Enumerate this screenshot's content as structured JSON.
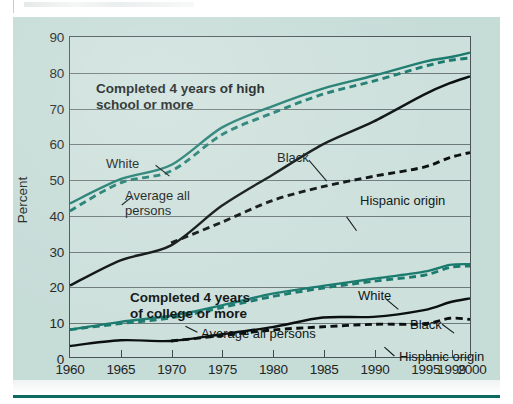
{
  "figure": {
    "background_color": "#c6dcd7",
    "accent_color": "#0d6b61",
    "teal_series_color": "#1b7a6e",
    "dark_series_color": "#0a0f10"
  },
  "chart_data": {
    "type": "line",
    "title": "",
    "xlabel": "",
    "ylabel": "Percent",
    "xlim": [
      1960,
      2000
    ],
    "ylim": [
      0,
      90
    ],
    "grid": true,
    "legend_position": "inline-annotations",
    "x": [
      1960,
      1965,
      1970,
      1975,
      1980,
      1985,
      1990,
      1995,
      1999,
      2000
    ],
    "xtick_labels": [
      "1960",
      "1965",
      "1970",
      "1975",
      "1980",
      "1985",
      "1990",
      "1995",
      "1999",
      "2000"
    ],
    "ytick_labels": [
      "0",
      "10",
      "20",
      "30",
      "40",
      "50",
      "60",
      "70",
      "80",
      "90"
    ],
    "ytick_values": [
      0,
      10,
      20,
      30,
      40,
      50,
      60,
      70,
      80,
      90
    ],
    "groups": [
      {
        "name": "Completed 4 years of high school or more",
        "series": [
          {
            "name": "White",
            "style": "solid",
            "color": "#1b7a6e",
            "values": [
              43.2,
              50.0,
              54.0,
              64.5,
              70.5,
              75.5,
              79.1,
              83.0,
              84.3,
              85.6
            ]
          },
          {
            "name": "Average all persons",
            "style": "dashed",
            "color": "#1b7a6e",
            "values": [
              41.1,
              49.0,
              52.3,
              62.5,
              68.6,
              73.9,
              77.6,
              81.7,
              83.4,
              84.1
            ]
          },
          {
            "name": "Black",
            "style": "solid",
            "color": "#0a0f10",
            "values": [
              20.1,
              27.2,
              31.4,
              42.5,
              51.2,
              59.8,
              66.2,
              73.8,
              77.0,
              78.9
            ]
          },
          {
            "name": "Hispanic origin",
            "style": "dashed",
            "color": "#0a0f10",
            "values": [
              null,
              null,
              32.1,
              37.9,
              44.0,
              47.9,
              50.8,
              53.4,
              56.1,
              57.5
            ]
          }
        ]
      },
      {
        "name": "Completed 4 years of college or more",
        "series": [
          {
            "name": "White",
            "style": "solid",
            "color": "#1b7a6e",
            "values": [
              7.7,
              9.9,
              11.6,
              14.5,
              17.8,
              20.0,
              22.0,
              24.0,
              25.9,
              26.1
            ]
          },
          {
            "name": "Average all persons",
            "style": "dashed",
            "color": "#1b7a6e",
            "values": [
              7.7,
              9.4,
              11.0,
              13.9,
              17.0,
              19.4,
              21.3,
              23.0,
              25.2,
              25.6
            ]
          },
          {
            "name": "Black",
            "style": "solid",
            "color": "#0a0f10",
            "values": [
              3.1,
              4.7,
              4.5,
              6.4,
              8.4,
              11.1,
              11.3,
              13.2,
              15.4,
              16.5
            ]
          },
          {
            "name": "Hispanic origin",
            "style": "dashed",
            "color": "#0a0f10",
            "values": [
              null,
              null,
              4.5,
              6.0,
              7.6,
              8.5,
              9.2,
              9.3,
              10.9,
              10.6
            ]
          }
        ]
      }
    ],
    "annotations": [
      {
        "key": "hs_title_line1",
        "text": "Completed 4 years of high"
      },
      {
        "key": "hs_title_line2",
        "text": "school or more"
      },
      {
        "key": "college_title_line1",
        "text": "Completed 4 years"
      },
      {
        "key": "college_title_line2",
        "text": "of college or more"
      },
      {
        "key": "hs_white",
        "text": "White"
      },
      {
        "key": "hs_avg_line1",
        "text": "Average all"
      },
      {
        "key": "hs_avg_line2",
        "text": "persons"
      },
      {
        "key": "hs_black",
        "text": "Black"
      },
      {
        "key": "hs_hispanic",
        "text": "Hispanic origin"
      },
      {
        "key": "col_white",
        "text": "White"
      },
      {
        "key": "col_avg",
        "text": "Average all persons"
      },
      {
        "key": "col_black",
        "text": "Black"
      },
      {
        "key": "col_hispanic",
        "text": "Hispanic origin"
      }
    ]
  }
}
